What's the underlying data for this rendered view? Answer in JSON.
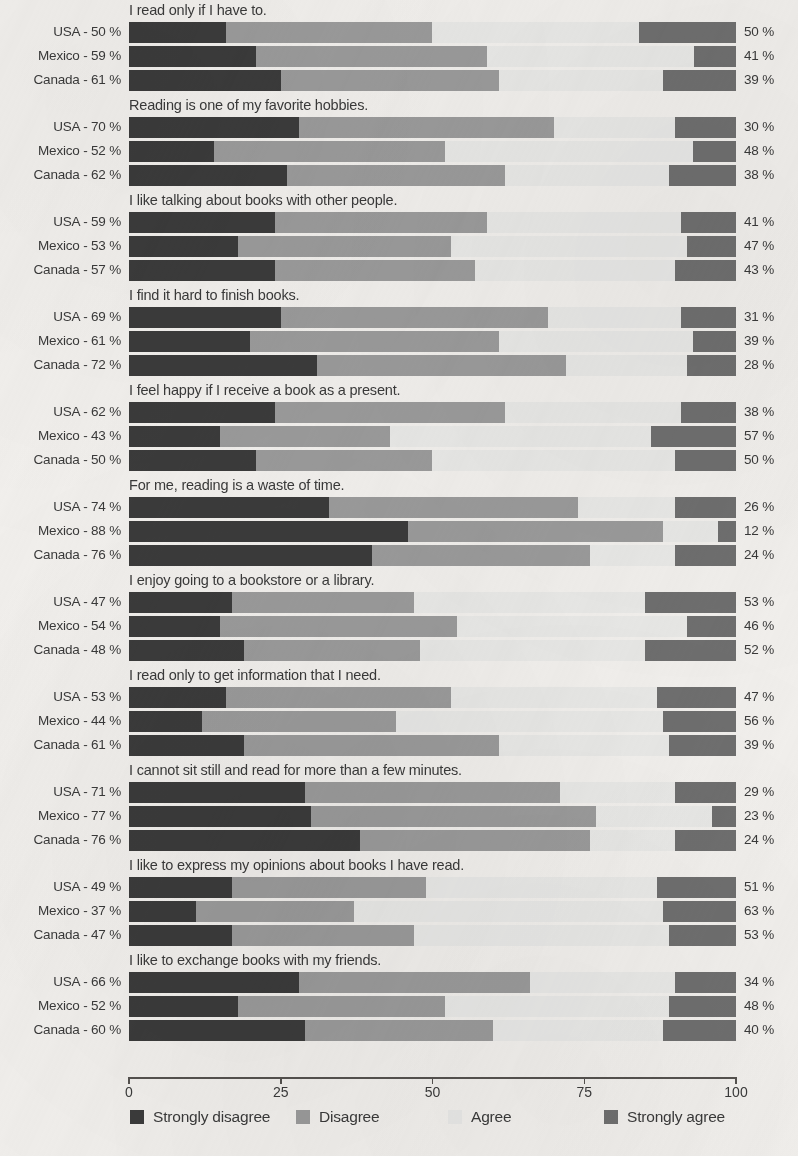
{
  "chart_data": {
    "type": "bar",
    "subtype": "stacked-horizontal-diverging-likert",
    "title": "",
    "xlabel": "",
    "ylabel": "",
    "xlim": [
      0,
      100
    ],
    "grid": false,
    "legend_position": "bottom",
    "axis": {
      "ticks": [
        0,
        25,
        50,
        75,
        100
      ],
      "tick_labels": [
        "0",
        "25",
        "50",
        "75",
        "100"
      ]
    },
    "legend": [
      {
        "label": "Strongly disagree",
        "color": "#3b3b3b",
        "key": "strongly_disagree"
      },
      {
        "label": "Disagree",
        "color": "#9b9b9b",
        "key": "disagree"
      },
      {
        "label": "Agree",
        "color": "#e9e9e7",
        "key": "agree"
      },
      {
        "label": "Strongly agree",
        "color": "#6f6f6f",
        "key": "strongly_agree"
      }
    ],
    "series_names": [
      "Strongly disagree",
      "Disagree",
      "Agree",
      "Strongly agree"
    ],
    "countries": [
      "USA",
      "Mexico",
      "Canada"
    ],
    "groups": [
      {
        "statement": "I read only if I have to.",
        "rows": [
          {
            "country": "USA",
            "left_label": "USA - 50 %",
            "right_label": "50 %",
            "disagree_total": 50,
            "agree_total": 50,
            "values": [
              16,
              34,
              34,
              16
            ]
          },
          {
            "country": "Mexico",
            "left_label": "Mexico - 59 %",
            "right_label": "41 %",
            "disagree_total": 59,
            "agree_total": 41,
            "values": [
              21,
              38,
              34,
              7
            ]
          },
          {
            "country": "Canada",
            "left_label": "Canada - 61 %",
            "right_label": "39 %",
            "disagree_total": 61,
            "agree_total": 39,
            "values": [
              25,
              36,
              27,
              12
            ]
          }
        ]
      },
      {
        "statement": "Reading is one of my favorite hobbies.",
        "rows": [
          {
            "country": "USA",
            "left_label": "USA - 70 %",
            "right_label": "30 %",
            "disagree_total": 70,
            "agree_total": 30,
            "values": [
              28,
              42,
              20,
              10
            ]
          },
          {
            "country": "Mexico",
            "left_label": "Mexico - 52 %",
            "right_label": "48 %",
            "disagree_total": 52,
            "agree_total": 48,
            "values": [
              14,
              38,
              41,
              7
            ]
          },
          {
            "country": "Canada",
            "left_label": "Canada - 62 %",
            "right_label": "38 %",
            "disagree_total": 62,
            "agree_total": 38,
            "values": [
              26,
              36,
              27,
              11
            ]
          }
        ]
      },
      {
        "statement": "I like talking about books with other people.",
        "rows": [
          {
            "country": "USA",
            "left_label": "USA - 59 %",
            "right_label": "41 %",
            "disagree_total": 59,
            "agree_total": 41,
            "values": [
              24,
              35,
              32,
              9
            ]
          },
          {
            "country": "Mexico",
            "left_label": "Mexico - 53 %",
            "right_label": "47 %",
            "disagree_total": 53,
            "agree_total": 47,
            "values": [
              18,
              35,
              39,
              8
            ]
          },
          {
            "country": "Canada",
            "left_label": "Canada - 57 %",
            "right_label": "43 %",
            "disagree_total": 57,
            "agree_total": 43,
            "values": [
              24,
              33,
              33,
              10
            ]
          }
        ]
      },
      {
        "statement": "I find it hard to finish books.",
        "rows": [
          {
            "country": "USA",
            "left_label": "USA - 69 %",
            "right_label": "31 %",
            "disagree_total": 69,
            "agree_total": 31,
            "values": [
              25,
              44,
              22,
              9
            ]
          },
          {
            "country": "Mexico",
            "left_label": "Mexico - 61 %",
            "right_label": "39 %",
            "disagree_total": 61,
            "agree_total": 39,
            "values": [
              20,
              41,
              32,
              7
            ]
          },
          {
            "country": "Canada",
            "left_label": "Canada - 72 %",
            "right_label": "28 %",
            "disagree_total": 72,
            "agree_total": 28,
            "values": [
              31,
              41,
              20,
              8
            ]
          }
        ]
      },
      {
        "statement": "I feel happy if I receive a book as a present.",
        "rows": [
          {
            "country": "USA",
            "left_label": "USA - 62 %",
            "right_label": "38 %",
            "disagree_total": 62,
            "agree_total": 38,
            "values": [
              24,
              38,
              29,
              9
            ]
          },
          {
            "country": "Mexico",
            "left_label": "Mexico - 43 %",
            "right_label": "57 %",
            "disagree_total": 43,
            "agree_total": 57,
            "values": [
              15,
              28,
              43,
              14
            ]
          },
          {
            "country": "Canada",
            "left_label": "Canada - 50 %",
            "right_label": "50 %",
            "disagree_total": 50,
            "agree_total": 50,
            "values": [
              21,
              29,
              40,
              10
            ]
          }
        ]
      },
      {
        "statement": "For me, reading is a waste of time.",
        "rows": [
          {
            "country": "USA",
            "left_label": "USA - 74 %",
            "right_label": "26 %",
            "disagree_total": 74,
            "agree_total": 26,
            "values": [
              33,
              41,
              16,
              10
            ]
          },
          {
            "country": "Mexico",
            "left_label": "Mexico - 88 %",
            "right_label": "12 %",
            "disagree_total": 88,
            "agree_total": 12,
            "values": [
              46,
              42,
              9,
              3
            ]
          },
          {
            "country": "Canada",
            "left_label": "Canada - 76 %",
            "right_label": "24 %",
            "disagree_total": 76,
            "agree_total": 24,
            "values": [
              40,
              36,
              14,
              10
            ]
          }
        ]
      },
      {
        "statement": "I enjoy going to a bookstore or a library.",
        "rows": [
          {
            "country": "USA",
            "left_label": "USA - 47 %",
            "right_label": "53 %",
            "disagree_total": 47,
            "agree_total": 53,
            "values": [
              17,
              30,
              38,
              15
            ]
          },
          {
            "country": "Mexico",
            "left_label": "Mexico - 54 %",
            "right_label": "46 %",
            "disagree_total": 54,
            "agree_total": 46,
            "values": [
              15,
              39,
              38,
              8
            ]
          },
          {
            "country": "Canada",
            "left_label": "Canada - 48 %",
            "right_label": "52 %",
            "disagree_total": 48,
            "agree_total": 52,
            "values": [
              19,
              29,
              37,
              15
            ]
          }
        ]
      },
      {
        "statement": "I read only to get information that I need.",
        "rows": [
          {
            "country": "USA",
            "left_label": "USA - 53 %",
            "right_label": "47 %",
            "disagree_total": 53,
            "agree_total": 47,
            "values": [
              16,
              37,
              34,
              13
            ]
          },
          {
            "country": "Mexico",
            "left_label": "Mexico - 44 %",
            "right_label": "56 %",
            "disagree_total": 44,
            "agree_total": 56,
            "values": [
              12,
              32,
              44,
              12
            ]
          },
          {
            "country": "Canada",
            "left_label": "Canada - 61 %",
            "right_label": "39 %",
            "disagree_total": 61,
            "agree_total": 39,
            "values": [
              19,
              42,
              28,
              11
            ]
          }
        ]
      },
      {
        "statement": "I cannot sit still and read for more than a few minutes.",
        "rows": [
          {
            "country": "USA",
            "left_label": "USA - 71 %",
            "right_label": "29 %",
            "disagree_total": 71,
            "agree_total": 29,
            "values": [
              29,
              42,
              19,
              10
            ]
          },
          {
            "country": "Mexico",
            "left_label": "Mexico - 77 %",
            "right_label": "23 %",
            "disagree_total": 77,
            "agree_total": 23,
            "values": [
              30,
              47,
              19,
              4
            ]
          },
          {
            "country": "Canada",
            "left_label": "Canada - 76 %",
            "right_label": "24 %",
            "disagree_total": 76,
            "agree_total": 24,
            "values": [
              38,
              38,
              14,
              10
            ]
          }
        ]
      },
      {
        "statement": "I like to express my opinions about books I have read.",
        "rows": [
          {
            "country": "USA",
            "left_label": "USA - 49 %",
            "right_label": "51 %",
            "disagree_total": 49,
            "agree_total": 51,
            "values": [
              17,
              32,
              38,
              13
            ]
          },
          {
            "country": "Mexico",
            "left_label": "Mexico - 37 %",
            "right_label": "63 %",
            "disagree_total": 37,
            "agree_total": 63,
            "values": [
              11,
              26,
              51,
              12
            ]
          },
          {
            "country": "Canada",
            "left_label": "Canada - 47 %",
            "right_label": "53 %",
            "disagree_total": 47,
            "agree_total": 53,
            "values": [
              17,
              30,
              42,
              11
            ]
          }
        ]
      },
      {
        "statement": "I like to exchange books with my friends.",
        "rows": [
          {
            "country": "USA",
            "left_label": "USA - 66 %",
            "right_label": "34 %",
            "disagree_total": 66,
            "agree_total": 34,
            "values": [
              28,
              38,
              24,
              10
            ]
          },
          {
            "country": "Mexico",
            "left_label": "Mexico - 52 %",
            "right_label": "48 %",
            "disagree_total": 52,
            "agree_total": 48,
            "values": [
              18,
              34,
              37,
              11
            ]
          },
          {
            "country": "Canada",
            "left_label": "Canada - 60 %",
            "right_label": "40 %",
            "disagree_total": 60,
            "agree_total": 40,
            "values": [
              29,
              31,
              28,
              12
            ]
          }
        ]
      }
    ]
  }
}
